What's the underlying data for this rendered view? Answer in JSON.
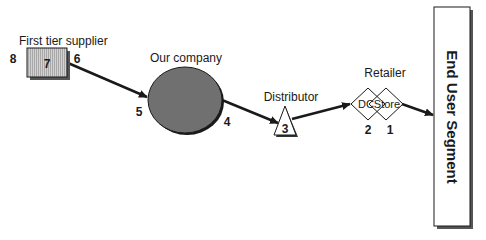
{
  "diagram": {
    "type": "supply-chain",
    "nodes": {
      "supplier": {
        "label": "First tier supplier",
        "inner_number": "7",
        "left_number": "8",
        "right_number": "6"
      },
      "company": {
        "label": "Our company",
        "left_number": "5",
        "right_number": "4"
      },
      "distributor": {
        "label": "Distributor",
        "inner_number": "3"
      },
      "retailer": {
        "label": "Retailer",
        "dc_label": "DC",
        "store_label": "Store",
        "dc_number": "2",
        "store_number": "1"
      },
      "end_user": {
        "label": "End User Segment"
      }
    },
    "edges": [
      {
        "from": "supplier",
        "to": "company"
      },
      {
        "from": "company",
        "to": "distributor"
      },
      {
        "from": "distributor",
        "to": "retailer"
      },
      {
        "from": "retailer",
        "to": "end_user"
      }
    ],
    "colors": {
      "supplier_fill": "#c8c8c8",
      "company_fill": "#707070",
      "line": "#1a1a1a",
      "shadow": "#555555"
    }
  }
}
